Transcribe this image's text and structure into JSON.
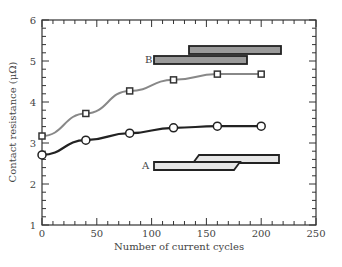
{
  "chart_data": {
    "type": "line",
    "title": "",
    "xlabel": "Number of current cycles",
    "ylabel": "Contact resistance (μΩ)",
    "xlim": [
      0,
      250
    ],
    "ylim": [
      1,
      6
    ],
    "x_ticks": [
      "0",
      "50",
      "100",
      "150",
      "200",
      "250"
    ],
    "y_ticks": [
      "1",
      "2",
      "3",
      "4",
      "5",
      "6"
    ],
    "grid": false,
    "x": [
      0,
      40,
      80,
      120,
      160,
      200
    ],
    "series": [
      {
        "name": "B",
        "marker": "square",
        "color": "#888888",
        "values": [
          3.17,
          3.72,
          4.27,
          4.54,
          4.68,
          4.68
        ]
      },
      {
        "name": "A",
        "marker": "circle",
        "color": "#222222",
        "values": [
          2.71,
          3.07,
          3.24,
          3.37,
          3.41,
          3.41
        ]
      }
    ],
    "annotations": [
      {
        "label": "B",
        "description": "overlapping dark-gray bars (lap joint)"
      },
      {
        "label": "A",
        "description": "light-gray bars with scarf/stepped joint"
      }
    ]
  }
}
